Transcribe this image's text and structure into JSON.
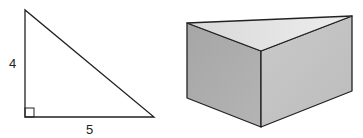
{
  "triangle": {
    "label_vertical": "4",
    "label_horizontal": "5",
    "vertices": {
      "top": [
        25,
        10
      ],
      "right_angle": [
        25,
        117
      ],
      "bottom_right": [
        154,
        117
      ]
    },
    "right_angle_marker": true
  },
  "prism": {
    "type": "triangular-prism",
    "vertices": {
      "top_left": [
        187,
        23
      ],
      "top_right": [
        352,
        16
      ],
      "top_front": [
        261,
        51
      ],
      "bottom_left": [
        187,
        98
      ],
      "bottom_right": [
        352,
        91
      ],
      "bottom_front": [
        261,
        127
      ]
    },
    "colors": {
      "top_face": "#e4e4e4",
      "left_face": "#a9a9a9",
      "right_face": "#c4c4c4",
      "edge": "#222222"
    }
  }
}
